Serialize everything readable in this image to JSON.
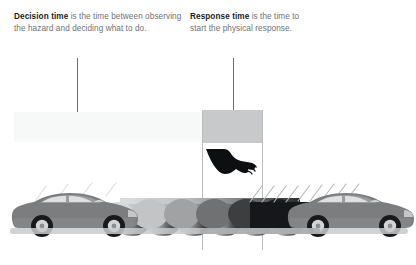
{
  "diagram": {
    "title_context": "Decision time and Response time braking diagram",
    "callouts": [
      {
        "id": "decision",
        "lead": "Decision time",
        "body": " is the time between observing the hazard and deciding what to do.",
        "arrow_name": "decision-time-arrow"
      },
      {
        "id": "response",
        "lead": "Response time",
        "body": " is the time to start the physical response.",
        "arrow_name": "response-time-arrow"
      }
    ],
    "bands": [
      {
        "id": "decision-band",
        "label": "decision-time-band",
        "color": "#f7f8f8"
      },
      {
        "id": "response-band",
        "label": "response-time-band",
        "color": "#c8c9ca"
      }
    ],
    "icons": {
      "foot": "foot-on-brake-pedal-icon",
      "arrow_head": "down-arrow-icon"
    },
    "scene": {
      "left_vehicle": "car-at-hazard-observation",
      "right_vehicle": "car-at-response-start",
      "motion_trail": "motion-blur-trail",
      "speed_lines": "motion-speed-lines",
      "ground": "road-shadow-line"
    },
    "colors": {
      "text_body": "#6f7173",
      "text_lead": "#1b1d1f",
      "arrow": "#6d6f71",
      "guide": "#b9bbbd",
      "band_light": "#f7f8f8",
      "band_dark": "#c8c9ca",
      "car_body": "#7b7d7f",
      "background": "#ffffff"
    }
  }
}
